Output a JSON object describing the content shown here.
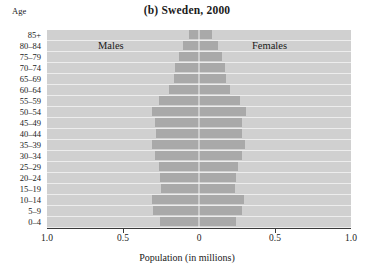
{
  "chart_data": {
    "type": "bar",
    "subtype": "population-pyramid",
    "title": "(b) Sweden, 2000",
    "xlabel": "Population (in millions)",
    "ylabel": "Age",
    "xlim": [
      -1.0,
      1.0
    ],
    "xtick_values": [
      -1.0,
      -0.5,
      0,
      0.5,
      1.0
    ],
    "xtick_labels": [
      "1.0",
      "0.5",
      "0",
      "0.5",
      "1.0"
    ],
    "grid": false,
    "legend_position": "inside-top",
    "left_series_label": "Males",
    "right_series_label": "Females",
    "categories": [
      "85+",
      "80–84",
      "75–79",
      "70–74",
      "65–69",
      "60–64",
      "55–59",
      "50–54",
      "45–49",
      "40–44",
      "35–39",
      "30–34",
      "25–29",
      "20–24",
      "15–19",
      "10–14",
      "5–9",
      "0–4"
    ],
    "series": [
      {
        "name": "Males",
        "side": "left",
        "values": [
          0.065,
          0.105,
          0.13,
          0.155,
          0.165,
          0.2,
          0.265,
          0.31,
          0.29,
          0.285,
          0.31,
          0.29,
          0.265,
          0.255,
          0.25,
          0.31,
          0.3,
          0.255
        ]
      },
      {
        "name": "Females",
        "side": "right",
        "values": [
          0.085,
          0.125,
          0.15,
          0.17,
          0.175,
          0.205,
          0.27,
          0.31,
          0.285,
          0.28,
          0.3,
          0.28,
          0.255,
          0.245,
          0.24,
          0.295,
          0.285,
          0.245
        ]
      }
    ],
    "colors": {
      "plot_background": "#d0d0d0",
      "bar_fill": "#a9a9a9",
      "row_separator": "#ededed",
      "axis": "#3a3a3a",
      "text": "#1a1a1a"
    }
  }
}
